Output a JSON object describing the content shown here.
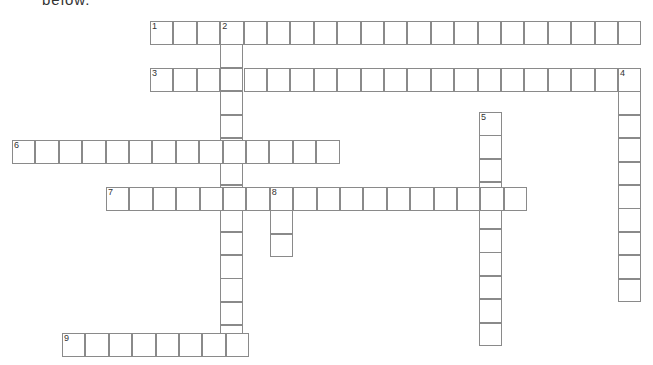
{
  "header": {
    "cut_text": "below."
  },
  "grid": {
    "cell_size": 23.4,
    "border_color": "#8a8a8a",
    "entries": [
      {
        "number": "1",
        "direction": "across",
        "x": 150,
        "y": 21,
        "length": 21
      },
      {
        "number": "2",
        "direction": "down",
        "x": 220,
        "y": 21,
        "length": 14
      },
      {
        "number": "3",
        "direction": "across",
        "x": 150,
        "y": 68,
        "length": 21
      },
      {
        "number": "4",
        "direction": "down",
        "x": 618,
        "y": 68,
        "length": 10
      },
      {
        "number": "5",
        "direction": "down",
        "x": 479,
        "y": 112,
        "length": 10
      },
      {
        "number": "6",
        "direction": "across",
        "x": 12,
        "y": 140,
        "length": 14
      },
      {
        "number": "7",
        "direction": "across",
        "x": 106,
        "y": 187,
        "length": 18
      },
      {
        "number": "8",
        "direction": "down",
        "x": 270,
        "y": 187,
        "length": 3
      },
      {
        "number": "9",
        "direction": "across",
        "x": 62,
        "y": 333,
        "length": 8
      }
    ]
  }
}
